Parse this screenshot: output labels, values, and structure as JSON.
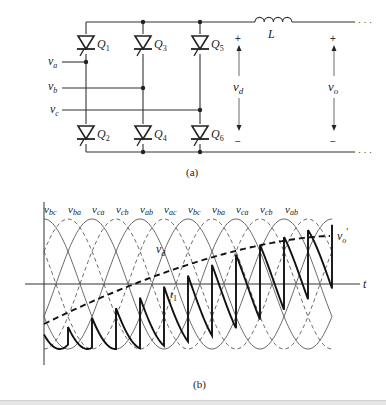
{
  "figure": {
    "part_a": {
      "caption": "(a)",
      "thyristors": [
        {
          "id": "Q1",
          "label": "Q",
          "sub": "1",
          "position": "upper",
          "column": 1
        },
        {
          "id": "Q3",
          "label": "Q",
          "sub": "3",
          "position": "upper",
          "column": 2
        },
        {
          "id": "Q5",
          "label": "Q",
          "sub": "5",
          "position": "upper",
          "column": 3
        },
        {
          "id": "Q2",
          "label": "Q",
          "sub": "2",
          "position": "lower",
          "column": 1
        },
        {
          "id": "Q4",
          "label": "Q",
          "sub": "4",
          "position": "lower",
          "column": 2
        },
        {
          "id": "Q6",
          "label": "Q",
          "sub": "6",
          "position": "lower",
          "column": 3
        }
      ],
      "inputs": [
        {
          "id": "va",
          "label": "v",
          "sub": "a"
        },
        {
          "id": "vb",
          "label": "v",
          "sub": "b"
        },
        {
          "id": "vc",
          "label": "v",
          "sub": "c"
        }
      ],
      "inductor": {
        "label": "L"
      },
      "vd": {
        "label": "v",
        "sub": "d",
        "plus": "+",
        "minus": "−"
      },
      "vo": {
        "label": "v",
        "sub": "o",
        "plus": "+",
        "minus": "−"
      },
      "continuation": "· · ·"
    },
    "part_b": {
      "caption": "(b)",
      "axis_label": "t",
      "curve_labels": [
        {
          "label": "v",
          "sub": "bc"
        },
        {
          "label": "v",
          "sub": "ba"
        },
        {
          "label": "v",
          "sub": "ca"
        },
        {
          "label": "v",
          "sub": "cb"
        },
        {
          "label": "v",
          "sub": "ab"
        },
        {
          "label": "v",
          "sub": "ac"
        },
        {
          "label": "v",
          "sub": "bc"
        },
        {
          "label": "v",
          "sub": "ba"
        },
        {
          "label": "v",
          "sub": "ca"
        },
        {
          "label": "v",
          "sub": "cb"
        },
        {
          "label": "v",
          "sub": "ab"
        }
      ],
      "vd_label": {
        "label": "v",
        "sub": "d"
      },
      "vo_prime_label": {
        "label": "v",
        "sub": "o",
        "prime": "′"
      },
      "t1_label": {
        "label": "t",
        "sub": "1"
      }
    }
  }
}
